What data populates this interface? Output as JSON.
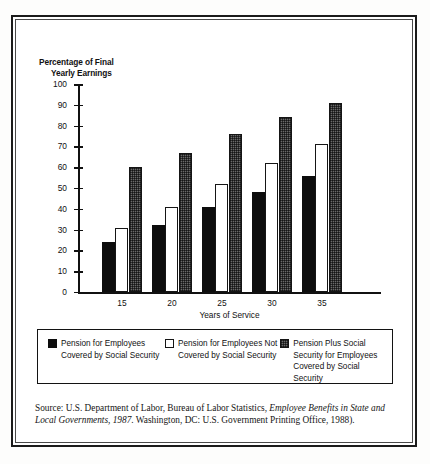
{
  "chart_data": {
    "type": "bar",
    "title": "",
    "ylabel": "Percentage of Final Yearly Earnings",
    "ylabel_line1": "Percentage of Final",
    "ylabel_line2": "Yearly Earnings",
    "xlabel": "Years of Service",
    "categories": [
      "15",
      "20",
      "25",
      "30",
      "35"
    ],
    "ylim": [
      0,
      100
    ],
    "yticks": [
      "100",
      "90",
      "80",
      "70",
      "60",
      "50",
      "40",
      "30",
      "20",
      "10",
      "0"
    ],
    "ytick_values": [
      100,
      90,
      80,
      70,
      60,
      50,
      40,
      30,
      20,
      10,
      0
    ],
    "grid": false,
    "legend_position": "bottom",
    "series": [
      {
        "name": "Pension for Employees Covered by Social Security",
        "name_line1": "Pension for Employees",
        "name_line2": "Covered by Social Security",
        "swatch": "black",
        "color": "#0d0d0d",
        "values": [
          24,
          32,
          41,
          48,
          56
        ]
      },
      {
        "name": "Pension for Employees Not Covered by Social Security",
        "name_line1": "Pension for Employees Not",
        "name_line2": "Covered by Social Security",
        "swatch": "white",
        "color": "#ffffff",
        "values": [
          31,
          41,
          52,
          62,
          71
        ]
      },
      {
        "name": "Pension Plus Social Security for Employees Covered by Social Security",
        "name_line1": "Pension Plus Social",
        "name_line2": "Security for Employees",
        "name_line3": "Covered by Social Security",
        "swatch": "gray",
        "color": "#6a6a6a",
        "values": [
          60,
          67,
          76,
          84,
          91
        ]
      }
    ]
  },
  "legend": {
    "items": [
      {
        "label": "Pension for Employees\nCovered by Social Security",
        "swatch": "black"
      },
      {
        "label": "Pension for Employees Not\nCovered by Social Security",
        "swatch": "white"
      },
      {
        "label": "Pension Plus Social\nSecurity for Employees\nCovered by Social Security",
        "swatch": "gray"
      }
    ]
  },
  "source": {
    "label": "Source:",
    "text_part1": "U.S. Department of Labor, Bureau of Labor Statistics, ",
    "italic1": "Employee Benefits in State and Local Governments, 1987",
    "text_part2": ". Washington, DC: U.S. Government Printing Office, 1988).",
    "full": "Source: U.S. Department of Labor, Bureau of Labor Statistics, Employee Benefits in State and Local Governments, 1987. Washington, DC: U.S. Government Printing Office, 1988)."
  }
}
